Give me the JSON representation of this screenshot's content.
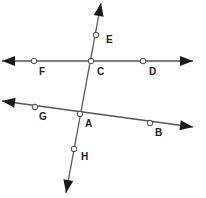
{
  "diagram": {
    "lines": [
      {
        "name": "line-FD",
        "from": [
          2,
          61
        ],
        "to": [
          193,
          61
        ]
      },
      {
        "name": "line-GB",
        "from": [
          2,
          101
        ],
        "to": [
          193,
          127
        ]
      },
      {
        "name": "line-EH",
        "from": [
          101,
          3
        ],
        "to": [
          66,
          193
        ]
      }
    ],
    "points": [
      {
        "label": "E",
        "x": 96,
        "y": 35,
        "lx": 106,
        "ly": 43
      },
      {
        "label": "F",
        "x": 34,
        "y": 61,
        "lx": 39,
        "ly": 75
      },
      {
        "label": "C",
        "x": 91,
        "y": 61,
        "lx": 97,
        "ly": 75
      },
      {
        "label": "D",
        "x": 143,
        "y": 61,
        "lx": 149,
        "ly": 75
      },
      {
        "label": "G",
        "x": 35,
        "y": 107,
        "lx": 39,
        "ly": 120
      },
      {
        "label": "A",
        "x": 80,
        "y": 114,
        "lx": 85,
        "ly": 127
      },
      {
        "label": "B",
        "x": 150,
        "y": 123,
        "lx": 155,
        "ly": 136
      },
      {
        "label": "H",
        "x": 74,
        "y": 149,
        "lx": 81,
        "ly": 160
      }
    ]
  }
}
